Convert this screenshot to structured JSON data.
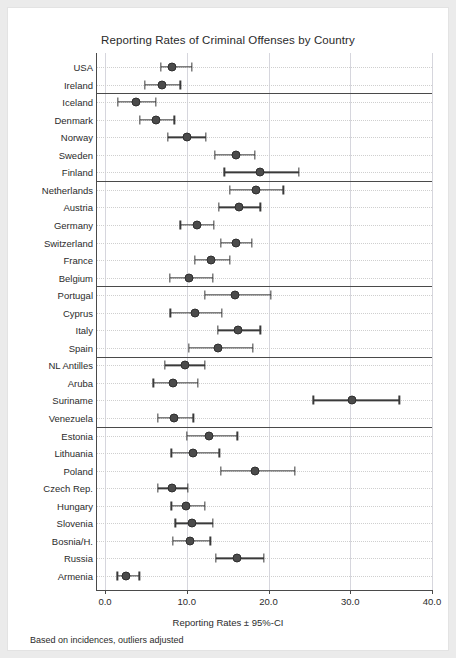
{
  "chart_data": {
    "type": "scatter",
    "title": "Reporting Rates of Criminal Offenses by Country",
    "xlabel": "Reporting Rates ± 95%-CI",
    "ylabel": "",
    "footnote": "Based on incidences, outliers adjusted",
    "xlim": [
      0.0,
      40.0
    ],
    "xticks": [
      0.0,
      10.0,
      20.0,
      30.0,
      40.0
    ],
    "xticklabels": [
      "0.0",
      "10.0",
      "20.0",
      "30.0",
      "40.0"
    ],
    "grid": "vertical gridlines at ticks, light dotted horizontal gridlines per row",
    "legend": "none",
    "orientation": "horizontal error bars (dot-and-whisker)",
    "group_separators_after": [
      "Ireland",
      "Finland",
      "Belgium",
      "Spain",
      "Venezuela"
    ],
    "categories": [
      "USA",
      "Ireland",
      "Iceland",
      "Denmark",
      "Norway",
      "Sweden",
      "Finland",
      "Netherlands",
      "Austria",
      "Germany",
      "Switzerland",
      "France",
      "Belgium",
      "Portugal",
      "Cyprus",
      "Italy",
      "Spain",
      "NL Antilles",
      "Aruba",
      "Suriname",
      "Venezuela",
      "Estonia",
      "Lithuania",
      "Poland",
      "Czech Rep.",
      "Hungary",
      "Slovenia",
      "Bosnia/H.",
      "Russia",
      "Armenia"
    ],
    "values": [
      8.2,
      7.0,
      3.8,
      6.2,
      10.0,
      16.0,
      19.0,
      18.5,
      16.4,
      11.3,
      16.0,
      13.0,
      10.3,
      15.9,
      11.0,
      16.3,
      13.8,
      9.8,
      8.3,
      30.2,
      8.5,
      12.7,
      10.8,
      18.4,
      8.2,
      9.9,
      10.7,
      10.4,
      16.2,
      2.6
    ],
    "ci_low": [
      6.8,
      4.9,
      1.6,
      4.3,
      7.7,
      13.4,
      14.6,
      15.3,
      13.9,
      9.2,
      14.2,
      11.0,
      7.9,
      12.2,
      8.0,
      13.8,
      10.3,
      7.3,
      5.9,
      25.5,
      6.5,
      10.0,
      8.1,
      14.2,
      6.5,
      8.1,
      8.6,
      8.3,
      13.6,
      1.5
    ],
    "ci_high": [
      10.6,
      9.2,
      6.2,
      8.5,
      12.3,
      18.3,
      23.7,
      21.8,
      19.0,
      13.3,
      18.0,
      15.3,
      13.2,
      20.3,
      14.3,
      19.0,
      18.1,
      12.2,
      11.4,
      36.0,
      10.8,
      16.2,
      14.0,
      23.2,
      10.1,
      12.2,
      13.2,
      12.9,
      19.4,
      4.2
    ]
  },
  "colors": {
    "marker": "#4b4b4b",
    "error_bar": "#3a3a3a",
    "axis": "#4a4a4a",
    "grid": "#d6d6dd",
    "page_background": "#ebebeb",
    "card_background": "#ffffff"
  }
}
